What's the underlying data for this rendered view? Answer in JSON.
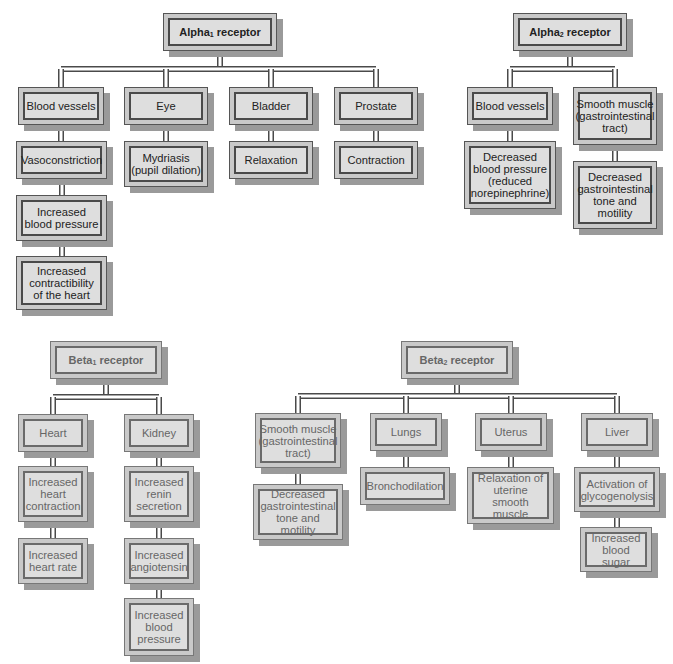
{
  "diagram": {
    "alpha1": {
      "title": "Alpha",
      "sub": "1",
      "title_suffix": " receptor",
      "branches": [
        {
          "label": "Blood vessels",
          "effects": [
            "Vasoconstriction",
            "Increased blood pressure",
            "Increased contractibility of the heart"
          ]
        },
        {
          "label": "Eye",
          "effects": [
            "Mydriasis (pupil dilation)"
          ]
        },
        {
          "label": "Bladder",
          "effects": [
            "Relaxation"
          ]
        },
        {
          "label": "Prostate",
          "effects": [
            "Contraction"
          ]
        }
      ]
    },
    "alpha2": {
      "title": "Alpha",
      "sub": "2",
      "title_suffix": " receptor",
      "branches": [
        {
          "label": "Blood vessels",
          "effects": [
            "Decreased blood pressure (reduced norepinephrine)"
          ]
        },
        {
          "label": "Smooth muscle (gastrointestinal tract)",
          "effects": [
            "Decreased gastrointestinal tone and motility"
          ]
        }
      ]
    },
    "beta1": {
      "title": "Beta",
      "sub": "1",
      "title_suffix": " receptor",
      "branches": [
        {
          "label": "Heart",
          "effects": [
            "Increased heart contraction",
            "Increased heart rate"
          ]
        },
        {
          "label": "Kidney",
          "effects": [
            "Increased renin secretion",
            "Increased angiotensin",
            "Increased blood pressure"
          ]
        }
      ]
    },
    "beta2": {
      "title": "Beta",
      "sub": "2",
      "title_suffix": " receptor",
      "branches": [
        {
          "label": "Smooth muscle (gastrointestinal tract)",
          "effects": [
            "Decreased gastrointestinal tone and motility"
          ]
        },
        {
          "label": "Lungs",
          "effects": [
            "Bronchodilation"
          ]
        },
        {
          "label": "Uterus",
          "effects": [
            "Relaxation of uterine smooth muscle"
          ]
        },
        {
          "label": "Liver",
          "effects": [
            "Activation of glycogenolysis",
            "Increased blood sugar"
          ]
        }
      ]
    }
  }
}
